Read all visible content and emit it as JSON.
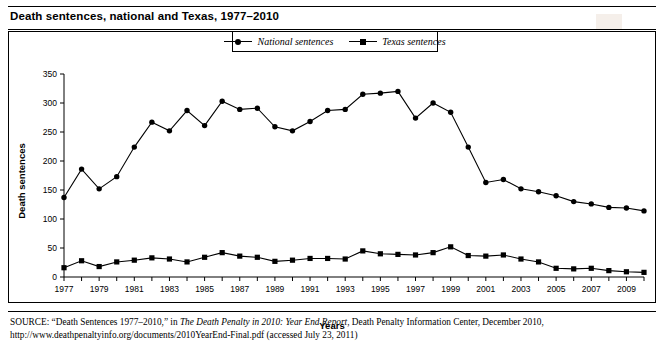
{
  "title": "Death sentences, national and Texas, 1977–2010",
  "legend": {
    "items": [
      {
        "label": "National sentences",
        "marker": "circle",
        "color": "#000000"
      },
      {
        "label": "Texas sentences",
        "marker": "square",
        "color": "#000000"
      }
    ],
    "position": "top-center"
  },
  "axis": {
    "x_title": "Years",
    "y_title": "Death sentences"
  },
  "source": {
    "prefix": "SOURCE:",
    "text_1": " “Death Sentences 1977–2010,” in ",
    "italic_1": "The Death Penalty in 2010: Year End Report",
    "text_2": ", Death Penalty Information Center, December 2010, http://www",
    "text_3": ".deathpenaltyinfo.org/documents/2010YearEnd-Final.pdf (accessed July 23, 2011)"
  },
  "chart_data": {
    "type": "line",
    "title": "Death sentences, national and Texas, 1977–2010",
    "xlabel": "Years",
    "ylabel": "Death sentences",
    "xlim": [
      1977,
      2010
    ],
    "ylim": [
      0,
      350
    ],
    "ytick_values": [
      0,
      50,
      100,
      150,
      200,
      250,
      300,
      350
    ],
    "xtick_labels": [
      "1977",
      "1979",
      "1981",
      "1983",
      "1985",
      "1987",
      "1989",
      "1991",
      "1993",
      "1995",
      "1997",
      "1999",
      "2001",
      "2003",
      "2005",
      "2007",
      "2009"
    ],
    "grid": false,
    "x": [
      1977,
      1978,
      1979,
      1980,
      1981,
      1982,
      1983,
      1984,
      1985,
      1986,
      1987,
      1988,
      1989,
      1990,
      1991,
      1992,
      1993,
      1994,
      1995,
      1996,
      1997,
      1998,
      1999,
      2000,
      2001,
      2002,
      2003,
      2004,
      2005,
      2006,
      2007,
      2008,
      2009,
      2010
    ],
    "series": [
      {
        "name": "National sentences",
        "marker": "circle",
        "values": [
          137,
          186,
          152,
          173,
          224,
          267,
          252,
          287,
          261,
          303,
          289,
          291,
          259,
          252,
          268,
          287,
          289,
          315,
          317,
          320,
          274,
          300,
          284,
          224,
          163,
          168,
          152,
          147,
          140,
          130,
          126,
          120,
          119,
          114
        ]
      },
      {
        "name": "Texas sentences",
        "marker": "square",
        "values": [
          16,
          28,
          18,
          26,
          29,
          33,
          31,
          26,
          34,
          42,
          36,
          34,
          27,
          29,
          32,
          32,
          31,
          45,
          40,
          39,
          38,
          42,
          52,
          37,
          36,
          38,
          31,
          26,
          15,
          14,
          15,
          11,
          9,
          8
        ]
      }
    ]
  }
}
